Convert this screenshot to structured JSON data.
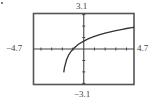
{
  "chart_data": {
    "type": "line",
    "title": "",
    "xlabel": "",
    "ylabel": "",
    "function": "y = ln(x + 2)",
    "window": {
      "xmin": -4.7,
      "xmax": 4.7,
      "ymin": -3.1,
      "ymax": 3.1,
      "xscl": 1,
      "yscl": 1
    },
    "xlim": [
      -4.7,
      4.7
    ],
    "ylim": [
      -3.1,
      3.1
    ],
    "grid": false,
    "legend": null,
    "x": [
      -1.87,
      -1.8,
      -1.6,
      -1.4,
      -1.2,
      -1.0,
      -0.5,
      0,
      0.5,
      1,
      1.5,
      2,
      2.5,
      3,
      3.5,
      4,
      4.5,
      4.7
    ],
    "values": [
      -2.04,
      -1.61,
      -0.92,
      -0.51,
      -0.22,
      0.0,
      0.41,
      0.69,
      0.92,
      1.1,
      1.25,
      1.39,
      1.5,
      1.61,
      1.7,
      1.79,
      1.87,
      1.9
    ],
    "tick_labels": {
      "top": "3.1",
      "bottom": "-3.1",
      "left": "-4.7",
      "right": "4.7"
    }
  },
  "labels": {
    "ymax": "3.1",
    "ymin": "−3.1",
    "xmin": "−4.7",
    "xmax": "4.7"
  },
  "colors": {
    "frame": "#555555",
    "axes": "#444444",
    "curve": "#333333",
    "text": "#444444"
  }
}
